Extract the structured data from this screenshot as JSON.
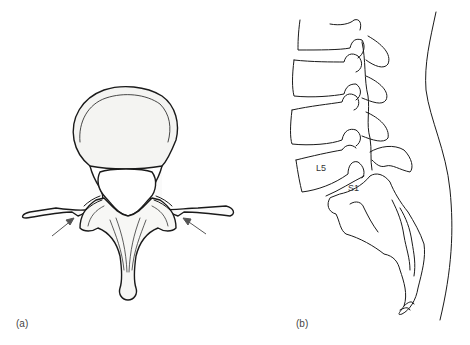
{
  "figure": {
    "panels": [
      {
        "id": "a",
        "label": "(a)",
        "view": "axial vertebra (superior view)",
        "arrows": 2
      },
      {
        "id": "b",
        "label": "(b)",
        "view": "lateral lumbosacral spine",
        "vertebra_labels": [
          "L5",
          "S1"
        ]
      }
    ]
  },
  "labels": {
    "panel_a": "(a)",
    "panel_b": "(b)",
    "l5": "L5",
    "s1": "S1"
  },
  "colors": {
    "line": "#1a1a1a",
    "body_fill": "#f4f4f2",
    "arrow": "#555555",
    "background": "#ffffff"
  }
}
